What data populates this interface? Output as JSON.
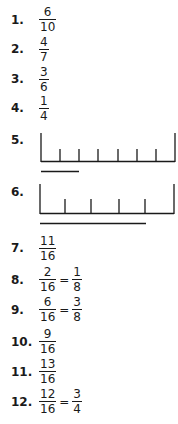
{
  "answers": [
    {
      "label": "1.",
      "num": "6",
      "den": "10"
    },
    {
      "label": "2.",
      "num": "4",
      "den": "7"
    },
    {
      "label": "3.",
      "num": "3",
      "den": "6"
    },
    {
      "label": "4.",
      "num": "1",
      "den": "4"
    },
    {
      "label": "5."
    },
    {
      "label": "6."
    },
    {
      "label": "7.",
      "num": "11",
      "den": "16"
    },
    {
      "label": "8.",
      "num": "2",
      "den": "16",
      "eq": "=",
      "num2": "1",
      "den2": "8"
    },
    {
      "label": "9.",
      "num": "6",
      "den": "16",
      "eq": "=",
      "num2": "3",
      "den2": "8"
    },
    {
      "label": "10.",
      "num": "9",
      "den": "16"
    },
    {
      "label": "11.",
      "num": "13",
      "den": "16"
    },
    {
      "label": "12.",
      "num": "12",
      "den": "16",
      "eq": "=",
      "num2": "3",
      "den2": "4"
    }
  ]
}
